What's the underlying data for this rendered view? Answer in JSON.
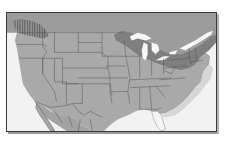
{
  "map": {
    "title": "",
    "region": "Continental United States with southern Canada and northern Mexico",
    "colors": {
      "ocean": "#f2f2f2",
      "land": "#a9a9a9",
      "canada": "#9c9c9c",
      "highlight_band": "#7f7f7f",
      "hatch": "#6e6e6e",
      "lakes": "#f7f7f7",
      "florida": "#f5f5f5",
      "borders": "#555555",
      "frame": "#3a3a3a"
    },
    "layers": [
      {
        "name": "pacific-northwest-hatched-region",
        "style": "hatched"
      },
      {
        "name": "great-lakes-northeast-band",
        "style": "dark-band"
      },
      {
        "name": "florida-peninsula",
        "style": "white-fill"
      },
      {
        "name": "state-borders",
        "style": "lines"
      }
    ]
  }
}
